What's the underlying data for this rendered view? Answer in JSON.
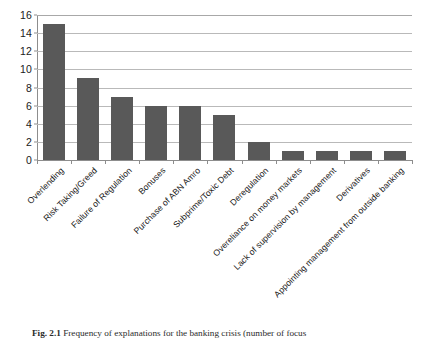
{
  "chart_data": {
    "type": "bar",
    "title": "",
    "xlabel": "",
    "ylabel": "",
    "ylim": [
      0,
      16
    ],
    "ytick_step": 2,
    "yticks": [
      "16",
      "14",
      "12",
      "10",
      "8",
      "6",
      "4",
      "2",
      "0"
    ],
    "grid": true,
    "legend": false,
    "bar_color": "#595959",
    "gridline_color": "#b9b9b9",
    "axis_color": "#8d8d8d",
    "categories": [
      "Overlending",
      "Risk Taking/Greed",
      "Failure of Regulation",
      "Bonuses",
      "Purchase of ABN Amro",
      "Subprime/Toxic Debt",
      "Deregulation",
      "Overeliance on money markets",
      "Lack of supervision by management",
      "Derivatives",
      "Appointing management from outside banking"
    ],
    "values": [
      15,
      9,
      7,
      6,
      6,
      5,
      2,
      1,
      1,
      1,
      1
    ]
  },
  "caption": {
    "figure_number": "Fig. 2.1",
    "text": "Frequency of explanations for the banking crisis (number of focus"
  }
}
